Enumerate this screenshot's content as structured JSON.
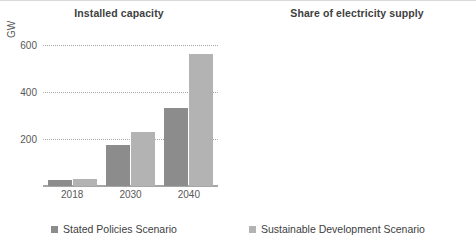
{
  "legend": {
    "items": [
      {
        "label": "Stated Policies Scenario",
        "key": "steps",
        "color": "#8c8c8c"
      },
      {
        "label": "Sustainable Development Scenario",
        "key": "sds",
        "color": "#b3b3b3"
      }
    ]
  },
  "chart_data": [
    {
      "type": "bar",
      "title": "Installed capacity",
      "xlabel": "",
      "ylabel": "GW",
      "categories": [
        "2018",
        "2030",
        "2040"
      ],
      "yticks": [
        "200",
        "400",
        "600"
      ],
      "ytick_values": [
        200,
        400,
        600
      ],
      "ylim": [
        0,
        650
      ],
      "grid": true,
      "legend_position": "bottom",
      "series": [
        {
          "name": "Stated Policies Scenario",
          "color": "#8c8c8c",
          "values": [
            25,
            175,
            330
          ]
        },
        {
          "name": "Sustainable Development Scenario",
          "color": "#b3b3b3",
          "values": [
            30,
            230,
            560
          ]
        }
      ]
    },
    {
      "type": "line",
      "title": "Share of electricity supply",
      "xlabel": "",
      "ylabel": "",
      "categories": [
        "2018",
        "2030",
        "2040"
      ],
      "x": [
        2018,
        2030,
        2040
      ],
      "yticks": [
        "2%",
        "4%",
        "6%"
      ],
      "ytick_values": [
        2,
        4,
        6
      ],
      "ylim": [
        0,
        6.8
      ],
      "xlim": [
        2018,
        2040
      ],
      "grid": true,
      "legend_position": "bottom",
      "series": [
        {
          "name": "Stated Policies Scenario",
          "color": "#8c8c8c",
          "points": [
            {
              "x": 2018,
              "y": 0.3
            },
            {
              "x": 2020,
              "y": 0.45
            },
            {
              "x": 2022,
              "y": 0.65
            },
            {
              "x": 2024,
              "y": 0.95
            },
            {
              "x": 2026,
              "y": 1.3
            },
            {
              "x": 2028,
              "y": 1.7
            },
            {
              "x": 2030,
              "y": 2.05
            },
            {
              "x": 2032,
              "y": 2.35
            },
            {
              "x": 2034,
              "y": 2.6
            },
            {
              "x": 2036,
              "y": 2.78
            },
            {
              "x": 2038,
              "y": 2.92
            },
            {
              "x": 2040,
              "y": 3.0
            }
          ]
        },
        {
          "name": "Sustainable Development Scenario",
          "color": "#b3b3b3",
          "points": [
            {
              "x": 2018,
              "y": 0.3
            },
            {
              "x": 2020,
              "y": 0.5
            },
            {
              "x": 2022,
              "y": 0.8
            },
            {
              "x": 2024,
              "y": 1.15
            },
            {
              "x": 2026,
              "y": 1.5
            },
            {
              "x": 2028,
              "y": 1.85
            },
            {
              "x": 2030,
              "y": 2.3
            },
            {
              "x": 2032,
              "y": 2.9
            },
            {
              "x": 2034,
              "y": 3.5
            },
            {
              "x": 2036,
              "y": 4.1
            },
            {
              "x": 2038,
              "y": 4.72
            },
            {
              "x": 2040,
              "y": 5.3
            }
          ]
        }
      ]
    }
  ]
}
